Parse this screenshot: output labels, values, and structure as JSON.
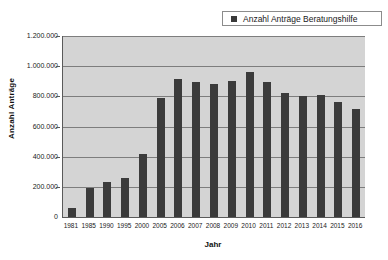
{
  "chart_data": {
    "type": "bar",
    "title": "",
    "xlabel": "Jahr",
    "ylabel": "Anzahl Anträge",
    "legend": [
      "Anzahl Anträge Beratungshilfe"
    ],
    "legend_position": "top-right",
    "grid": true,
    "ylim": [
      0,
      1200000
    ],
    "ytick_labels": [
      "1.200.000",
      "1.000.000",
      "800.000",
      "600.000",
      "400.000",
      "200.000",
      "0"
    ],
    "ytick_values": [
      1200000,
      1000000,
      800000,
      600000,
      400000,
      200000,
      0
    ],
    "categories": [
      "1981",
      "1985",
      "1990",
      "1995",
      "2000",
      "2005",
      "2006",
      "2007",
      "2008",
      "2009",
      "2010",
      "2011",
      "2012",
      "2013",
      "2014",
      "2015",
      "2016"
    ],
    "values": [
      60000,
      190000,
      235000,
      260000,
      420000,
      790000,
      915000,
      895000,
      880000,
      905000,
      960000,
      895000,
      825000,
      805000,
      810000,
      760000,
      715000
    ],
    "series": [
      {
        "name": "Anzahl Anträge Beratungshilfe",
        "color": "#3b3b3b",
        "values": [
          60000,
          190000,
          235000,
          260000,
          420000,
          790000,
          915000,
          895000,
          880000,
          905000,
          960000,
          895000,
          825000,
          805000,
          810000,
          760000,
          715000
        ]
      }
    ],
    "colors": {
      "bar": "#3b3b3b",
      "plot_background": "#d4d4d4",
      "gridline": "#7d7d7d",
      "axis": "#5a5a5a",
      "page_background": "#ffffff"
    }
  }
}
